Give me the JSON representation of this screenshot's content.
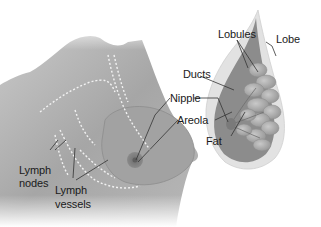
{
  "diagram": {
    "colors": {
      "background": "#ffffff",
      "skin": "#a9a9a9",
      "tissue": "#8f8f8f",
      "lobules": "#b5b5b5",
      "areola": "#7a7a7a",
      "leader_line": "#333333",
      "text": "#1a1a1a"
    },
    "labels": {
      "lobules": "Lobules",
      "lobe": "Lobe",
      "ducts": "Ducts",
      "nipple": "Nipple",
      "areola": "Areola",
      "fat": "Fat",
      "lymph_nodes_line1": "Lymph",
      "lymph_nodes_line2": "nodes",
      "lymph_vessels_line1": "Lymph",
      "lymph_vessels_line2": "vessels"
    }
  }
}
